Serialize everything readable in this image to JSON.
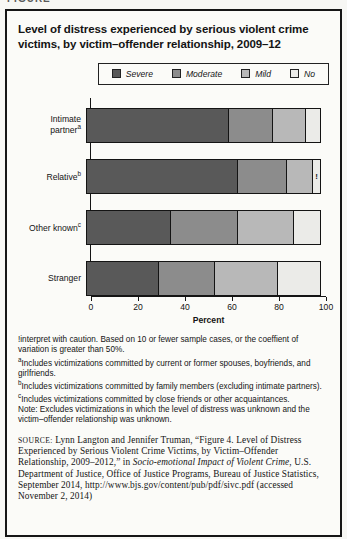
{
  "header": {
    "figure_label": "FIGURE"
  },
  "chart": {
    "title": "Level of distress experienced by serious violent crime victims, by victim–offender relationship, 2009–12"
  },
  "chart_data": {
    "type": "bar",
    "orientation": "horizontal",
    "stacked": true,
    "unit": "percent",
    "title": "Level of distress experienced by serious violent crime victims, by victim–offender relationship, 2009–12",
    "xlabel": "Percent",
    "ylabel": "",
    "xlim": [
      0,
      100
    ],
    "x_ticks": [
      0,
      20,
      40,
      60,
      80,
      100
    ],
    "grid": false,
    "legend_position": "top-right",
    "categories": [
      {
        "label": "Intimate partner",
        "sup": "a"
      },
      {
        "label": "Relative",
        "sup": "b"
      },
      {
        "label": "Other known",
        "sup": "c"
      },
      {
        "label": "Stranger",
        "sup": ""
      }
    ],
    "series": [
      {
        "name": "Severe",
        "color": "#595959",
        "values": [
          61,
          65,
          36,
          31
        ]
      },
      {
        "name": "Moderate",
        "color": "#8c8c8c",
        "values": [
          19,
          21,
          29,
          24
        ]
      },
      {
        "name": "Mild",
        "color": "#b8b8b8",
        "values": [
          14,
          11,
          24,
          27
        ]
      },
      {
        "name": "No",
        "color": "#ebebe8",
        "values": [
          6,
          3,
          11,
          18
        ]
      }
    ],
    "annotations": [
      {
        "category_index": 1,
        "series_index": 3,
        "text": "!"
      }
    ]
  },
  "footnotes": [
    {
      "marker": "!",
      "sup": false,
      "text": "interpret with caution. Based on 10 or fewer sample cases, or the coeffient of variation is greater than 50%."
    },
    {
      "marker": "a",
      "sup": true,
      "text": "Includes victimizations committed by current or former spouses, boyfriends, and girlfriends."
    },
    {
      "marker": "b",
      "sup": true,
      "text": "Includes victimizations committed by family members (excluding intimate partners)."
    },
    {
      "marker": "c",
      "sup": true,
      "text": "Includes victimizations committed by close friends or other acquaintances."
    },
    {
      "marker": "",
      "sup": false,
      "text": "Note: Excludes victimizations in which the level of distress was unknown and the victim–offender relationship was unknown."
    }
  ],
  "source": {
    "label": "SOURCE:",
    "text_before_italic": " Lynn Langton and Jennifer Truman, “Figure 4. Level of Distress Experienced by Serious Violent Crime Victims, by Victim–Offender Relationship, 2009–2012,” in ",
    "italic": "Socio-emotional Impact of Violent Crime",
    "text_after_italic": ", U.S. Department of Justice, Office of Justice Programs, Bureau of Justice Statistics, September 2014, http://www.bjs.gov/content/pub/pdf/sivc.pdf (accessed November 2, 2014)"
  },
  "colors": {
    "frame_border": "#161616",
    "axis": "#141414",
    "background": "#fbfbf8"
  }
}
